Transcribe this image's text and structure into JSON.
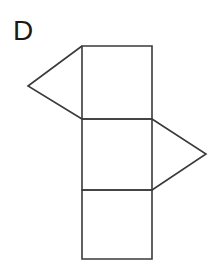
{
  "figure": {
    "label": "D",
    "background_color": "#ffffff",
    "stroke_color": "#3a3a3a",
    "label_color": "#1a1a1a",
    "stroke_width": 1.6,
    "canvas": {
      "width": 221,
      "height": 270
    },
    "shapes": [
      {
        "name": "square-top",
        "type": "square",
        "points": "82,46 152,46 152,119 82,119"
      },
      {
        "name": "square-middle",
        "type": "square",
        "points": "82,119 152,119 152,190 82,190"
      },
      {
        "name": "square-bottom",
        "type": "square",
        "points": "82,190 152,190 152,259 82,259"
      },
      {
        "name": "triangle-left",
        "type": "triangle",
        "points": "82,46 28,86 82,119"
      },
      {
        "name": "triangle-right",
        "type": "triangle",
        "points": "152,119 206,154 152,190"
      }
    ]
  }
}
